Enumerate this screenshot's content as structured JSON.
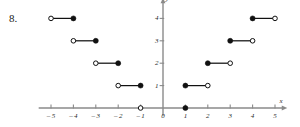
{
  "figure": {
    "problem_number": "8.",
    "x_axis_label": "x",
    "y_axis_label": "y"
  },
  "chart_data": {
    "type": "line",
    "title": "",
    "xlabel": "x",
    "ylabel": "y",
    "xlim": [
      -5.6,
      5.6
    ],
    "ylim": [
      -0.6,
      4.6
    ],
    "grid": false,
    "legend": null,
    "xticks": [
      -5,
      -4,
      -3,
      -2,
      -1,
      0,
      1,
      2,
      3,
      4,
      5
    ],
    "xtick_labels": [
      "-5",
      "-4",
      "-3",
      "-2",
      "-1",
      "0",
      "1",
      "2",
      "3",
      "4",
      "5"
    ],
    "yticks": [
      1,
      2,
      3,
      4
    ],
    "ytick_labels": [
      "1",
      "2",
      "3",
      "4"
    ],
    "segments": [
      {
        "x0": -5,
        "x1": -4,
        "y": 4,
        "left_endpoint": "open",
        "right_endpoint": "filled"
      },
      {
        "x0": -4,
        "x1": -3,
        "y": 3,
        "left_endpoint": "open",
        "right_endpoint": "filled"
      },
      {
        "x0": -3,
        "x1": -2,
        "y": 2,
        "left_endpoint": "open",
        "right_endpoint": "filled"
      },
      {
        "x0": -2,
        "x1": -1,
        "y": 1,
        "left_endpoint": "open",
        "right_endpoint": "filled"
      },
      {
        "x0": 1,
        "x1": 2,
        "y": 1,
        "left_endpoint": "filled",
        "right_endpoint": "open"
      },
      {
        "x0": 2,
        "x1": 3,
        "y": 2,
        "left_endpoint": "filled",
        "right_endpoint": "open"
      },
      {
        "x0": 3,
        "x1": 4,
        "y": 3,
        "left_endpoint": "filled",
        "right_endpoint": "open"
      },
      {
        "x0": 4,
        "x1": 5,
        "y": 4,
        "left_endpoint": "filled",
        "right_endpoint": "open"
      }
    ],
    "isolated_points": [
      {
        "x": -1,
        "y": 0,
        "style": "open"
      },
      {
        "x": 1,
        "y": 0,
        "style": "filled"
      }
    ],
    "colors": {
      "axis": "#8a8a8a",
      "data": "#111111",
      "background": "#ffffff"
    }
  }
}
